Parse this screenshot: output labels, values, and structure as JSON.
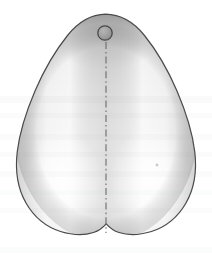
{
  "figure": {
    "canvas": {
      "width": 212,
      "height": 259,
      "background": "#ffffff"
    },
    "outline": {
      "name": "pear-shaped-crown-outline",
      "stroke_color": "#4a4a4a",
      "stroke_width": 1.2,
      "description": "Rounded pear / heart shaped outline, narrow rounded apex at top, widest at lower third, two rounded lobes at bottom separated by a shallow central notch",
      "apex_top": {
        "x": 105,
        "y": 14
      },
      "widest_left": {
        "x": 16,
        "y": 160
      },
      "widest_right": {
        "x": 196,
        "y": 158
      },
      "bottom_notch": {
        "x": 106,
        "y": 235
      },
      "bottom_left_lobe": {
        "x": 60,
        "y": 233
      },
      "bottom_right_lobe": {
        "x": 152,
        "y": 232
      }
    },
    "fill": {
      "base_color": "#d8d8d8",
      "highlight_color": "#fdfdfd",
      "shadow_color": "#bcbcbc",
      "top_shade_color": "#c9c9c9",
      "lobe_highlight_left": {
        "cx": 62,
        "cy": 180
      },
      "lobe_highlight_right": {
        "cx": 150,
        "cy": 178
      }
    },
    "center_line": {
      "name": "vertical-center-axis",
      "style": "dash-dot",
      "color": "#6b6b6b",
      "width": 1.1,
      "x": 106,
      "y_start": 42,
      "y_end": 233,
      "dash_pattern": "7 3 1.6 3"
    },
    "marker": {
      "name": "cusp-tip-marker",
      "shape": "circle",
      "cx": 105,
      "cy": 33,
      "r": 7.2,
      "fill_color": "#9e9e9e",
      "stroke_color": "#4a4a4a",
      "stroke_width": 1.3
    },
    "scan_bands": [
      {
        "y": 96,
        "height": 7,
        "opacity": 0.05
      },
      {
        "y": 113,
        "height": 5,
        "opacity": 0.04
      },
      {
        "y": 134,
        "height": 6,
        "opacity": 0.045
      },
      {
        "y": 152,
        "height": 5,
        "opacity": 0.04
      },
      {
        "y": 171,
        "height": 6,
        "opacity": 0.045
      },
      {
        "y": 190,
        "height": 5,
        "opacity": 0.035
      },
      {
        "y": 208,
        "height": 5,
        "opacity": 0.03
      },
      {
        "y": 247,
        "height": 6,
        "opacity": 0.035
      }
    ],
    "speck": {
      "name": "scan-speck",
      "cx": 157,
      "cy": 165,
      "r": 1.4,
      "color": "#b0b0b0"
    }
  }
}
